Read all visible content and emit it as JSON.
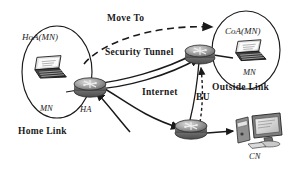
{
  "figure": {
    "title_implied": "Mobile IP handover with security tunnel",
    "background_color": "#ffffff",
    "ink_color": "#1a1a1a"
  },
  "labels": {
    "move_to": "Move To",
    "security_tunnel": "Security Tunnel",
    "internet": "Internet",
    "bu": "BU",
    "outside_link": "Outside Link",
    "home_link": "Home Link",
    "hoa_mn": "HoA(MN)",
    "coa_mn": "CoA(MN)",
    "mn_home": "MN",
    "mn_foreign": "MN",
    "ha": "HA",
    "cn": "CN"
  },
  "nodes": [
    {
      "id": "mn-home",
      "kind": "laptop-icon",
      "label": "MN",
      "inside": "home-link-ellipse"
    },
    {
      "id": "ha-router",
      "kind": "router-icon",
      "label": "HA"
    },
    {
      "id": "fa-router",
      "kind": "router-icon",
      "label": ""
    },
    {
      "id": "mn-foreign",
      "kind": "laptop-icon",
      "label": "MN",
      "inside": "outside-link-ellipse"
    },
    {
      "id": "cn-router",
      "kind": "router-icon",
      "label": ""
    },
    {
      "id": "cn-host",
      "kind": "desktop-icon",
      "label": "CN"
    }
  ],
  "regions": [
    {
      "id": "home-link-ellipse",
      "label": "Home Link",
      "address": "HoA(MN)"
    },
    {
      "id": "outside-link-ellipse",
      "label": "Outside Link",
      "address": "CoA(MN)"
    }
  ],
  "links": [
    {
      "id": "move-to-arrow",
      "style": "dashed",
      "label": "Move To",
      "from": "mn-home",
      "to": "outside-link-ellipse"
    },
    {
      "id": "security-tunnel",
      "style": "double-solid",
      "label": "Security Tunnel",
      "from": "ha-router",
      "to": "fa-router"
    },
    {
      "id": "internet-path",
      "style": "solid",
      "label": "Internet",
      "from": "ha-router",
      "to": "cn-router"
    },
    {
      "id": "bu-signal",
      "style": "dotted",
      "label": "BU",
      "from": "cn-router",
      "to": "fa-router"
    },
    {
      "id": "cn-access",
      "style": "solid",
      "label": "",
      "from": "cn-router",
      "to": "cn-host"
    }
  ]
}
